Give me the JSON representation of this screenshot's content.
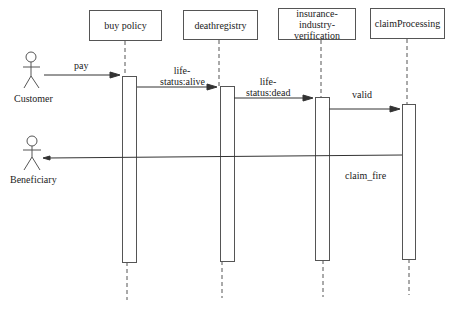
{
  "diagram": {
    "type": "sequence",
    "actors": [
      {
        "name": "Customer"
      },
      {
        "name": "Beneficiary"
      }
    ],
    "lifelines": [
      {
        "name": "buy policy"
      },
      {
        "name": "deathregistry"
      },
      {
        "name": "insurance-industry-verification",
        "line1": "insurance-industry-",
        "line2": "verification"
      },
      {
        "name": "claimProcessing"
      }
    ],
    "messages": [
      {
        "from": "Customer",
        "to": "buy policy",
        "label": "pay"
      },
      {
        "from": "buy policy",
        "to": "deathregistry",
        "label": "life-status:alive",
        "line1": "life-",
        "line2": "status:alive"
      },
      {
        "from": "deathregistry",
        "to": "insurance-industry-verification",
        "label": "life-status:dead",
        "line1": "life-",
        "line2": "status:dead"
      },
      {
        "from": "insurance-industry-verification",
        "to": "claimProcessing",
        "label": "valid"
      },
      {
        "from": "claimProcessing",
        "to": "Beneficiary",
        "label": "claim_fire"
      }
    ],
    "colors": {
      "line": "#555555",
      "text": "#222222",
      "background": "#ffffff"
    }
  }
}
